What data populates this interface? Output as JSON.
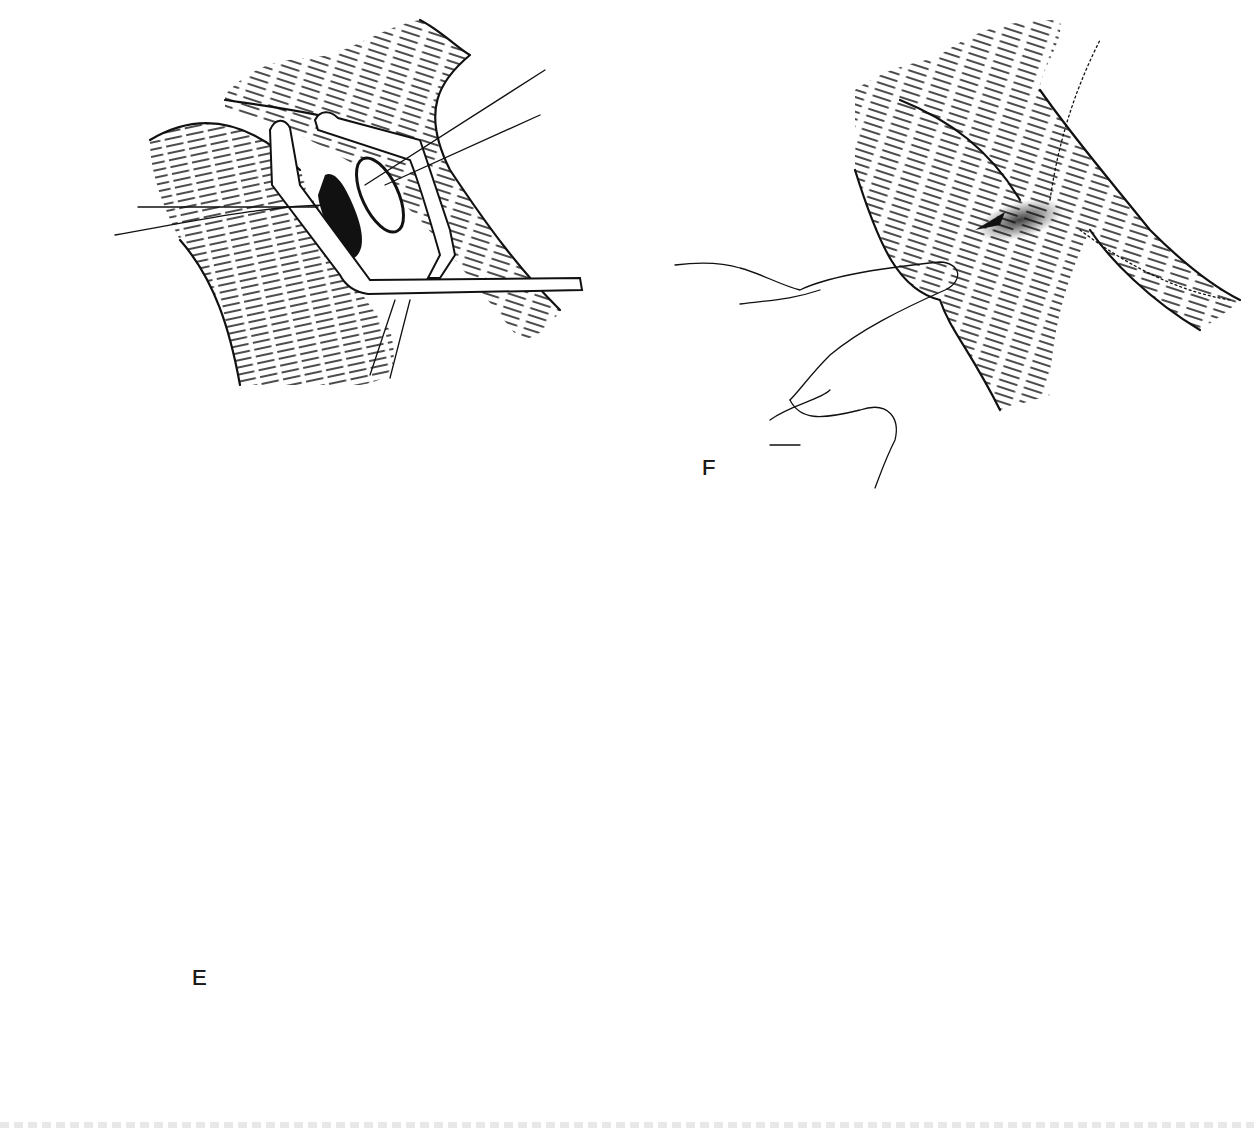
{
  "figure": {
    "panels": [
      {
        "id": "panel-top-left",
        "label": "",
        "description": "Vessel junction with side-biting clamp and incision"
      },
      {
        "id": "panel-f",
        "label": "F",
        "description": "Finger compressing vessel at completed anastomosis"
      },
      {
        "id": "panel-e-upper",
        "label": "",
        "description": "Clamp with running suture placed in anastomosis"
      },
      {
        "id": "panel-e-lower",
        "label": "E",
        "description": "Completed suture line with needles on suture ends"
      }
    ],
    "labels": {
      "f": "F",
      "e": "E"
    },
    "caption_visible": false
  }
}
